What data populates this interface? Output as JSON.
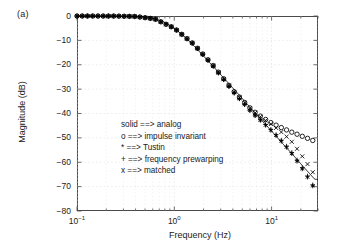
{
  "figure": {
    "subfigure_label": "(a)",
    "background": "#ffffff",
    "axis_color": "#4a4a4a",
    "grid_color": "#dddddd",
    "data_color": "#000000"
  },
  "chart_data": {
    "type": "line",
    "title": "",
    "subtitle": "",
    "xlabel": "Frequency (Hz)",
    "ylabel": "Magnitude (dB)",
    "xscale": "log",
    "yscale": "linear",
    "xlim": [
      0.1,
      30
    ],
    "ylim": [
      -80,
      0
    ],
    "xticks": [
      0.1,
      1,
      10
    ],
    "xticklabels": [
      "10-1",
      "100",
      "101"
    ],
    "yticks": [
      0,
      -10,
      -20,
      -30,
      -40,
      -50,
      -60,
      -70,
      -80
    ],
    "yticklabels": [
      "0",
      "-10",
      "-20",
      "-30",
      "-40",
      "-50",
      "-60",
      "-70",
      "-80"
    ],
    "grid": true,
    "legend_position": "center-left-inside",
    "legend_entries": [
      "solid ==> analog",
      "o ==> impulse invariant",
      "* ==> Tustin",
      "+ ==> frequency prewarping",
      "x ==> matched"
    ],
    "series": [
      {
        "name": "analog",
        "marker": "solid-line",
        "x": [
          0.1,
          0.13,
          0.17,
          0.22,
          0.28,
          0.36,
          0.46,
          0.6,
          0.77,
          1.0,
          1.29,
          1.67,
          2.15,
          2.78,
          3.59,
          4.64,
          5.99,
          7.74,
          10.0,
          12.9,
          16.7,
          21.5,
          27.8
        ],
        "values": [
          0.0,
          0.0,
          -0.01,
          -0.02,
          -0.05,
          -0.14,
          -0.38,
          -0.97,
          -2.3,
          -5.0,
          -8.7,
          -13.1,
          -17.8,
          -22.6,
          -27.5,
          -32.4,
          -37.4,
          -42.3,
          -47.2,
          -52.2,
          -57.1,
          -62.1,
          -67.0
        ]
      },
      {
        "name": "impulse invariant",
        "marker": "o",
        "x": [
          0.1,
          0.16,
          0.25,
          0.4,
          0.63,
          1.0,
          1.58,
          2.5,
          4.0,
          6.3,
          8.0,
          10.0,
          12.0,
          14.0,
          16.0,
          18.0,
          20.0,
          22.0,
          25.0,
          28.0
        ],
        "values": [
          0.0,
          -0.01,
          -0.03,
          -0.2,
          -1.2,
          -5.0,
          -11.5,
          -20.2,
          -30.5,
          -38.6,
          -41.6,
          -43.9,
          -45.4,
          -46.6,
          -47.6,
          -48.4,
          -49.1,
          -49.8,
          -50.6,
          -51.5
        ]
      },
      {
        "name": "Tustin",
        "marker": "*",
        "x": [
          0.1,
          0.16,
          0.25,
          0.4,
          0.63,
          1.0,
          1.58,
          2.5,
          4.0,
          6.3,
          8.0,
          10.0,
          12.0,
          14.0,
          16.0,
          18.0,
          20.0,
          22.0,
          25.0,
          28.0
        ],
        "values": [
          0.0,
          -0.01,
          -0.03,
          -0.2,
          -1.2,
          -5.0,
          -11.6,
          -20.5,
          -31.0,
          -39.8,
          -43.5,
          -47.2,
          -50.4,
          -53.5,
          -56.3,
          -59.2,
          -62.1,
          -64.0,
          -68.4,
          -71.0
        ]
      },
      {
        "name": "frequency prewarping",
        "marker": "+",
        "x": [
          0.1,
          0.16,
          0.25,
          0.4,
          0.63,
          1.0,
          1.58,
          2.5,
          4.0,
          6.3,
          8.0,
          10.0,
          12.0,
          14.0,
          16.0,
          18.0,
          20.0,
          22.0,
          25.0,
          28.0
        ],
        "values": [
          0.0,
          -0.01,
          -0.03,
          -0.2,
          -1.2,
          -5.0,
          -11.6,
          -20.5,
          -31.0,
          -39.6,
          -43.2,
          -46.8,
          -50.0,
          -53.0,
          -55.8,
          -58.7,
          -61.5,
          -63.5,
          -67.9,
          -70.6
        ]
      },
      {
        "name": "matched",
        "marker": "x",
        "x": [
          0.1,
          0.16,
          0.25,
          0.4,
          0.63,
          1.0,
          1.58,
          2.5,
          4.0,
          6.3,
          8.0,
          10.0,
          12.0,
          14.0,
          16.0,
          18.0,
          20.0,
          22.0,
          25.0,
          28.0
        ],
        "values": [
          0.0,
          -0.01,
          -0.03,
          -0.2,
          -1.2,
          -5.0,
          -11.5,
          -20.3,
          -30.6,
          -38.8,
          -41.9,
          -44.5,
          -46.9,
          -49.2,
          -51.4,
          -54.1,
          -56.8,
          -59.0,
          -62.6,
          -65.5
        ]
      }
    ]
  }
}
